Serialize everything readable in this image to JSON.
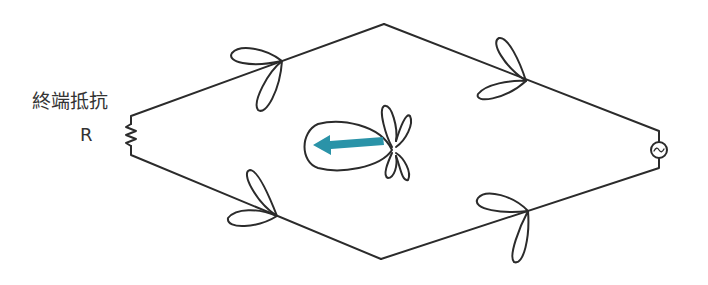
{
  "labels": {
    "resistor_title": "終端抵抗",
    "resistor_symbol": "R"
  },
  "colors": {
    "line": "#2b2b2b",
    "arrow": "#2a93a8",
    "background": "#ffffff"
  },
  "components": {
    "termination": "resistor-icon",
    "source": "ac-source-icon",
    "radiation_pattern": "antenna-pattern-icon",
    "direction": "left-arrow-icon"
  }
}
